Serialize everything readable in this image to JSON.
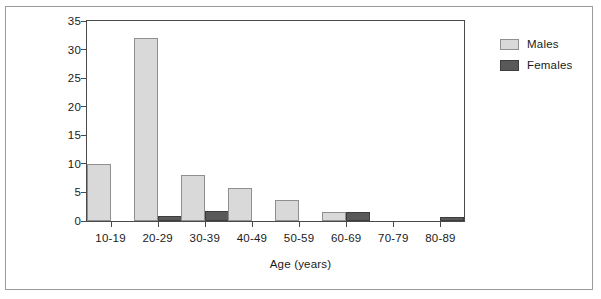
{
  "chart_data": {
    "type": "bar",
    "title": "",
    "subtitle": "",
    "xlabel": "Age (years)",
    "ylabel": "",
    "categories": [
      "10-19",
      "20-29",
      "30-39",
      "40-49",
      "50-59",
      "60-69",
      "70-79",
      "80-89"
    ],
    "series": [
      {
        "name": "Males",
        "color": "#d9d9d9",
        "values": [
          10,
          32,
          8,
          5.7,
          3.7,
          1.6,
          0,
          0
        ]
      },
      {
        "name": "Females",
        "color": "#595959",
        "values": [
          0,
          0.9,
          1.8,
          0,
          0,
          1.6,
          0,
          0.7
        ]
      }
    ],
    "ylim": [
      0,
      35
    ],
    "yticks": [
      0,
      5,
      10,
      15,
      20,
      25,
      30,
      35
    ],
    "ytick_labels": [
      "0",
      "5",
      "10",
      "15",
      "20",
      "25",
      "30",
      "35"
    ],
    "grid": false,
    "legend_position": "top-right-outside",
    "legend_entries": [
      "Males",
      "Females"
    ]
  },
  "legend": {
    "items": [
      {
        "label": "Males"
      },
      {
        "label": "Females"
      }
    ]
  },
  "axis": {
    "x_title": "Age (years)"
  }
}
